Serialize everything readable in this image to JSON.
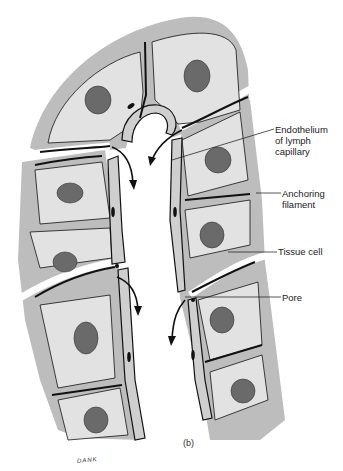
{
  "figure": {
    "caption": "(b)",
    "signature": "DANK",
    "colors": {
      "tissue": "#bdbdbd",
      "cell": "#e2e2e2",
      "nucleus": "#6a6a6a",
      "outline": "#111111",
      "background": "#ffffff"
    }
  },
  "labels": {
    "endothelium": [
      "Endothelium",
      "of lymph",
      "capillary"
    ],
    "anchoring": [
      "Anchoring",
      "filament"
    ],
    "tissue_cell": "Tissue cell",
    "pore": "Pore"
  }
}
